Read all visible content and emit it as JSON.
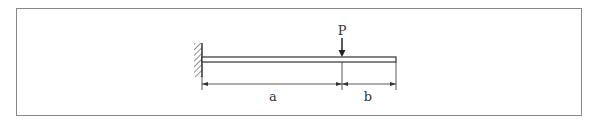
{
  "diagram": {
    "type": "cantilever-beam-point-load",
    "support": "fixed-wall-left",
    "load": {
      "label": "P",
      "direction": "down"
    },
    "dimensions": [
      {
        "label": "a",
        "from": "fixed-end",
        "to": "load-point"
      },
      {
        "label": "b",
        "from": "load-point",
        "to": "free-end"
      }
    ],
    "colors": {
      "line": "#333333",
      "frame": "#888888",
      "background": "#ffffff"
    }
  }
}
